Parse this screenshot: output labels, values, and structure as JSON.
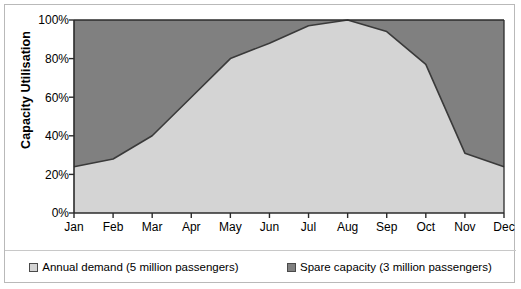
{
  "chart_data": {
    "type": "area",
    "stacked": true,
    "title": "",
    "xlabel": "",
    "ylabel": "Capacity Utilisation",
    "categories": [
      "Jan",
      "Feb",
      "Mar",
      "Apr",
      "May",
      "Jun",
      "Jul",
      "Aug",
      "Sep",
      "Oct",
      "Nov",
      "Dec"
    ],
    "ylim": [
      0,
      100
    ],
    "yticks": [
      "0%",
      "20%",
      "40%",
      "60%",
      "80%",
      "100%"
    ],
    "ytick_values": [
      0,
      20,
      40,
      60,
      80,
      100
    ],
    "grid": false,
    "legend_position": "bottom",
    "series": [
      {
        "name": "Annual demand (5 million passengers)",
        "color": "#d4d4d4",
        "values": [
          24,
          28,
          40,
          60,
          80,
          88,
          97,
          100,
          94,
          77,
          31,
          24
        ]
      },
      {
        "name": "Spare capacity (3 million passengers)",
        "color": "#808080",
        "values": [
          76,
          72,
          60,
          40,
          20,
          12,
          3,
          0,
          6,
          23,
          69,
          76
        ]
      }
    ]
  },
  "axes": {
    "y_title": "Capacity Utilisation",
    "y_ticks": [
      "100%",
      "80%",
      "60%",
      "40%",
      "20%",
      "0%"
    ],
    "x_ticks": [
      "Jan",
      "Feb",
      "Mar",
      "Apr",
      "May",
      "Jun",
      "Jul",
      "Aug",
      "Sep",
      "Oct",
      "Nov",
      "Dec"
    ]
  },
  "legend": {
    "entries": [
      {
        "label": "Annual demand (5 million passengers)",
        "swatch": "#d4d4d4"
      },
      {
        "label": "Spare capacity (3 million passengers)",
        "swatch": "#808080"
      }
    ]
  },
  "colors": {
    "demand_fill": "#d4d4d4",
    "spare_fill": "#808080",
    "boundary_line": "#3a3a3a",
    "axis": "#2b2b2b",
    "frame": "#b9b9b9"
  }
}
